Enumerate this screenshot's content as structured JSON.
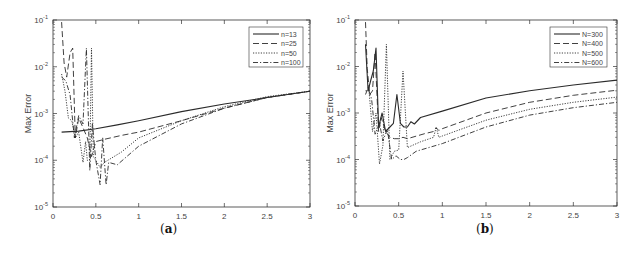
{
  "chart_data": [
    {
      "type": "line",
      "panel_label": "(a)",
      "title": "",
      "xlabel": "Shape Parameter",
      "ylabel": "Max Error",
      "xlim": [
        0,
        3
      ],
      "ylim": [
        1e-05,
        0.1
      ],
      "yscale": "log",
      "xticks": [
        "0",
        "0.5",
        "1",
        "1.5",
        "2",
        "2.5",
        "3"
      ],
      "yticks": [
        "10^-5",
        "10^-4",
        "10^-3",
        "10^-2",
        "10^-1"
      ],
      "grid": false,
      "legend_position": "upper right",
      "series": [
        {
          "name": "n=13",
          "style": "solid",
          "x": [
            0.1,
            0.3,
            0.5,
            0.75,
            1.0,
            1.5,
            2.0,
            2.5,
            3.0
          ],
          "y": [
            0.0004,
            0.00042,
            0.00047,
            0.00057,
            0.0007,
            0.0011,
            0.0016,
            0.0022,
            0.003
          ]
        },
        {
          "name": "n=25",
          "style": "dashed",
          "x": [
            0.1,
            0.13,
            0.16,
            0.2,
            0.23,
            0.26,
            0.3,
            0.35,
            0.4,
            0.45,
            0.5,
            0.6,
            0.8,
            1.0,
            1.5,
            2.0,
            2.5,
            3.0
          ],
          "y": [
            0.09,
            0.012,
            0.006,
            0.02,
            0.025,
            0.0003,
            0.0008,
            0.0005,
            0.0003,
            0.00012,
            0.00025,
            0.00028,
            0.00034,
            0.0004,
            0.0007,
            0.0013,
            0.0022,
            0.003
          ]
        },
        {
          "name": "n=50",
          "style": "dotted",
          "x": [
            0.1,
            0.14,
            0.18,
            0.22,
            0.26,
            0.3,
            0.35,
            0.38,
            0.4,
            0.43,
            0.45,
            0.47,
            0.5,
            0.55,
            0.6,
            0.8,
            1.0,
            1.5,
            2.0,
            2.5,
            3.0
          ],
          "y": [
            0.007,
            0.003,
            0.0008,
            0.0007,
            0.0003,
            0.0004,
            9e-05,
            0.00025,
            0.0001,
            0.0001,
            0.025,
            0.00012,
            0.0001,
            7e-05,
            9e-05,
            0.00015,
            0.0003,
            0.0007,
            0.0014,
            0.0023,
            0.003
          ]
        },
        {
          "name": "n=100",
          "style": "dashdot",
          "x": [
            0.1,
            0.15,
            0.2,
            0.25,
            0.3,
            0.35,
            0.39,
            0.43,
            0.46,
            0.5,
            0.55,
            0.58,
            0.62,
            0.65,
            0.75,
            1.0,
            1.5,
            2.0,
            2.5,
            3.0
          ],
          "y": [
            0.006,
            0.005,
            0.0025,
            0.0003,
            0.0009,
            0.0006,
            0.025,
            6e-05,
            0.0006,
            0.0001,
            3e-05,
            0.0003,
            3e-05,
            9e-05,
            8e-05,
            0.0002,
            0.0006,
            0.0013,
            0.0022,
            0.003
          ]
        }
      ]
    },
    {
      "type": "line",
      "panel_label": "(b)",
      "title": "",
      "xlabel": "Shape Parameter",
      "ylabel": "Max Error",
      "xlim": [
        0,
        3
      ],
      "ylim": [
        1e-05,
        0.1
      ],
      "yscale": "log",
      "xticks": [
        "0",
        "0.5",
        "1",
        "1.5",
        "2",
        "2.5",
        "3"
      ],
      "yticks": [
        "10^-5",
        "10^-4",
        "10^-3",
        "10^-2",
        "10^-1"
      ],
      "grid": false,
      "legend_position": "upper right",
      "series": [
        {
          "name": "N=300",
          "style": "solid",
          "x": [
            0.12,
            0.15,
            0.18,
            0.21,
            0.24,
            0.27,
            0.31,
            0.35,
            0.4,
            0.44,
            0.48,
            0.52,
            0.56,
            0.6,
            0.64,
            0.68,
            0.75,
            1.0,
            1.5,
            2.0,
            2.5,
            3.0
          ],
          "y": [
            0.03,
            0.003,
            0.005,
            0.008,
            0.025,
            0.0005,
            0.001,
            0.0004,
            0.0005,
            0.0006,
            0.0025,
            0.0006,
            0.0005,
            0.0005,
            0.00065,
            0.00058,
            0.0008,
            0.0011,
            0.0021,
            0.003,
            0.004,
            0.0051
          ]
        },
        {
          "name": "N=400",
          "style": "dashed",
          "x": [
            0.12,
            0.14,
            0.17,
            0.2,
            0.23,
            0.27,
            0.3,
            0.35,
            0.4,
            0.45,
            0.5,
            0.55,
            0.6,
            0.8,
            0.9,
            0.93,
            0.96,
            1.0,
            1.5,
            2.0,
            2.5,
            3.0
          ],
          "y": [
            0.09,
            0.009,
            0.0025,
            0.003,
            0.02,
            0.0004,
            0.0008,
            0.0004,
            0.0003,
            0.00028,
            0.00028,
            0.0003,
            0.00028,
            0.00036,
            0.0004,
            0.00048,
            0.00042,
            0.00046,
            0.001,
            0.0017,
            0.0024,
            0.0031
          ]
        },
        {
          "name": "N=500",
          "style": "dotted",
          "x": [
            0.12,
            0.16,
            0.2,
            0.24,
            0.28,
            0.32,
            0.36,
            0.4,
            0.45,
            0.5,
            0.55,
            0.6,
            0.75,
            0.9,
            0.93,
            0.96,
            1.0,
            1.5,
            2.0,
            2.5,
            3.0
          ],
          "y": [
            0.003,
            0.003,
            0.0004,
            0.001,
            8e-05,
            0.0002,
            0.03,
            0.0001,
            0.00015,
            0.00016,
            0.008,
            0.00018,
            0.00024,
            0.0003,
            0.0005,
            0.0003,
            0.00032,
            0.0007,
            0.0012,
            0.0017,
            0.0022
          ]
        },
        {
          "name": "N=600",
          "style": "dashdot",
          "x": [
            0.12,
            0.15,
            0.19,
            0.23,
            0.28,
            0.32,
            0.37,
            0.42,
            0.47,
            0.52,
            0.56,
            0.6,
            0.7,
            1.0,
            1.5,
            2.0,
            2.5,
            3.0
          ],
          "y": [
            0.0025,
            0.0035,
            0.002,
            0.00035,
            0.0006,
            0.00025,
            0.00045,
            0.0001,
            0.00012,
            0.0001,
            0.0001,
            0.00011,
            0.00015,
            0.00022,
            0.0005,
            0.0009,
            0.0013,
            0.0017
          ]
        }
      ]
    }
  ],
  "panels": [
    {
      "caption": "a",
      "xlabel": "Shape Parameter",
      "ylabel": "Max Error"
    },
    {
      "caption": "b",
      "xlabel": "Shape Parameter",
      "ylabel": "Max Error"
    }
  ],
  "colors": {
    "axis": "#333333",
    "line": "#2b2b2b",
    "text": "#444444"
  }
}
